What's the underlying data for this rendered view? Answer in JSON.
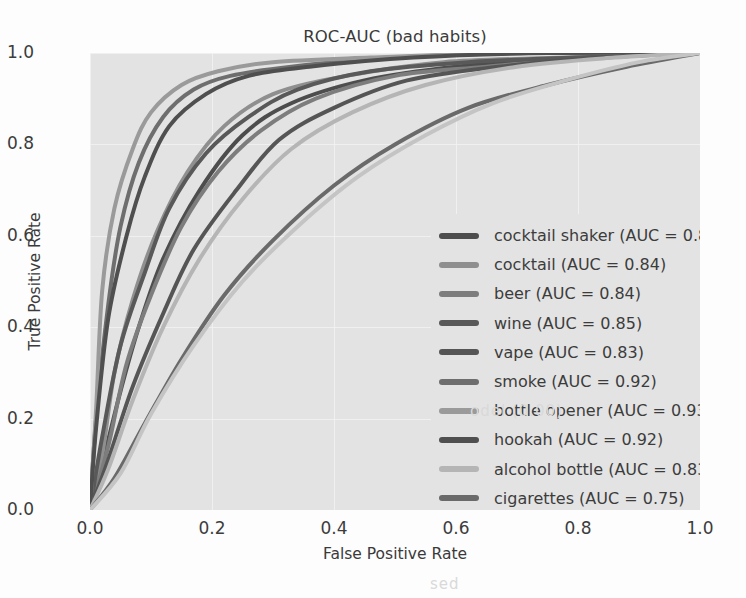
{
  "chart_data": {
    "type": "line",
    "title": "ROC-AUC (bad habits)",
    "xlabel": "False Positive Rate",
    "ylabel": "True Positive Rate",
    "xlim": [
      0.0,
      1.0
    ],
    "ylim": [
      0.0,
      1.0
    ],
    "xticks": [
      "0.0",
      "0.2",
      "0.4",
      "0.6",
      "0.8",
      "1.0"
    ],
    "yticks": [
      "0.0",
      "0.2",
      "0.4",
      "0.6",
      "0.8",
      "1.0"
    ],
    "grid": true,
    "legend_position": "lower right (inside axes)",
    "plot_background": "#e3e3e3",
    "series": [
      {
        "name": "cocktail shaker",
        "auc": 0.82,
        "legend_label": "cocktail shaker (AUC = 0.82)",
        "color": "#4d4d4d",
        "x": [
          0.0,
          0.02,
          0.05,
          0.08,
          0.12,
          0.18,
          0.25,
          0.33,
          0.45,
          0.6,
          0.8,
          1.0
        ],
        "y": [
          0.0,
          0.1,
          0.26,
          0.4,
          0.55,
          0.7,
          0.82,
          0.89,
          0.94,
          0.97,
          0.99,
          1.0
        ]
      },
      {
        "name": "cocktail",
        "auc": 0.84,
        "legend_label": "cocktail (AUC = 0.84)",
        "color": "#8f8f8f",
        "x": [
          0.0,
          0.02,
          0.04,
          0.07,
          0.11,
          0.16,
          0.22,
          0.3,
          0.42,
          0.58,
          0.78,
          1.0
        ],
        "y": [
          0.0,
          0.12,
          0.3,
          0.46,
          0.61,
          0.74,
          0.84,
          0.91,
          0.95,
          0.98,
          0.99,
          1.0
        ]
      },
      {
        "name": "beer",
        "auc": 0.84,
        "legend_label": "beer (AUC = 0.84)",
        "color": "#7d7d7d",
        "x": [
          0.0,
          0.03,
          0.06,
          0.1,
          0.15,
          0.21,
          0.28,
          0.37,
          0.5,
          0.65,
          0.82,
          1.0
        ],
        "y": [
          0.0,
          0.14,
          0.32,
          0.47,
          0.62,
          0.74,
          0.83,
          0.9,
          0.95,
          0.97,
          0.99,
          1.0
        ]
      },
      {
        "name": "wine",
        "auc": 0.85,
        "legend_label": "wine (AUC = 0.85)",
        "color": "#595959",
        "x": [
          0.0,
          0.02,
          0.05,
          0.09,
          0.13,
          0.19,
          0.26,
          0.34,
          0.46,
          0.62,
          0.8,
          1.0
        ],
        "y": [
          0.0,
          0.16,
          0.36,
          0.52,
          0.66,
          0.78,
          0.86,
          0.92,
          0.96,
          0.98,
          0.99,
          1.0
        ]
      },
      {
        "name": "vape",
        "auc": 0.83,
        "legend_label": "vape (AUC = 0.83)",
        "color": "#555555",
        "x": [
          0.0,
          0.03,
          0.07,
          0.12,
          0.17,
          0.24,
          0.31,
          0.4,
          0.52,
          0.67,
          0.84,
          1.0
        ],
        "y": [
          0.0,
          0.11,
          0.27,
          0.43,
          0.57,
          0.7,
          0.81,
          0.88,
          0.94,
          0.97,
          0.99,
          1.0
        ]
      },
      {
        "name": "smoke",
        "auc": 0.92,
        "legend_label": "smoke (AUC = 0.92)",
        "color": "#6e6e6e",
        "x": [
          0.0,
          0.01,
          0.03,
          0.05,
          0.08,
          0.12,
          0.17,
          0.23,
          0.33,
          0.5,
          0.72,
          1.0
        ],
        "y": [
          0.0,
          0.2,
          0.45,
          0.62,
          0.76,
          0.86,
          0.92,
          0.95,
          0.97,
          0.99,
          1.0,
          1.0
        ]
      },
      {
        "name": "bottle opener",
        "auc": 0.93,
        "legend_label": "bottle opener (AUC = 0.93)",
        "color": "#9a9a9a",
        "x": [
          0.0,
          0.01,
          0.02,
          0.04,
          0.07,
          0.1,
          0.15,
          0.21,
          0.3,
          0.46,
          0.7,
          1.0
        ],
        "y": [
          0.0,
          0.22,
          0.48,
          0.66,
          0.79,
          0.87,
          0.93,
          0.96,
          0.98,
          0.99,
          1.0,
          1.0
        ]
      },
      {
        "name": "hookah",
        "auc": 0.92,
        "legend_label": "hookah (AUC = 0.92)",
        "color": "#4f4f4f",
        "x": [
          0.0,
          0.01,
          0.03,
          0.06,
          0.09,
          0.13,
          0.19,
          0.26,
          0.36,
          0.53,
          0.75,
          1.0
        ],
        "y": [
          0.0,
          0.18,
          0.42,
          0.6,
          0.73,
          0.84,
          0.91,
          0.95,
          0.97,
          0.99,
          1.0,
          1.0
        ]
      },
      {
        "name": "alcohol bottle",
        "auc": 0.83,
        "legend_label": "alcohol bottle (AUC = 0.83)",
        "color": "#b5b5b5",
        "x": [
          0.0,
          0.03,
          0.07,
          0.12,
          0.18,
          0.25,
          0.33,
          0.43,
          0.55,
          0.7,
          0.86,
          1.0
        ],
        "y": [
          0.0,
          0.09,
          0.24,
          0.4,
          0.55,
          0.68,
          0.79,
          0.87,
          0.93,
          0.97,
          0.99,
          1.0
        ]
      },
      {
        "name": "cigarettes",
        "auc": 0.75,
        "legend_label": "cigarettes (AUC = 0.75)",
        "color": "#6a6a6a",
        "x": [
          0.0,
          0.04,
          0.09,
          0.15,
          0.22,
          0.3,
          0.4,
          0.5,
          0.62,
          0.75,
          0.88,
          1.0
        ],
        "y": [
          0.0,
          0.07,
          0.19,
          0.33,
          0.47,
          0.59,
          0.71,
          0.8,
          0.88,
          0.93,
          0.97,
          1.0
        ]
      },
      {
        "name": "pack of cigarettes",
        "auc": 0.76,
        "legend_label": "pack of cigarettes (AUC = 0.76)",
        "color": "#c4c4c4",
        "x": [
          0.0,
          0.05,
          0.1,
          0.17,
          0.25,
          0.34,
          0.44,
          0.55,
          0.66,
          0.78,
          0.9,
          1.0
        ],
        "y": [
          0.0,
          0.08,
          0.21,
          0.36,
          0.5,
          0.62,
          0.73,
          0.82,
          0.89,
          0.94,
          0.98,
          1.0
        ]
      }
    ]
  }
}
